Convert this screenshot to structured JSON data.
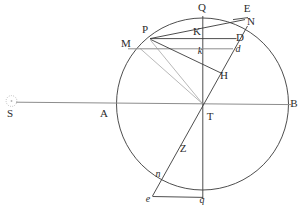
{
  "figure": {
    "background_color": "#ffffff",
    "ink_color": "#3a3a3a",
    "width": 307,
    "height": 209
  },
  "geometry": {
    "circle": {
      "cx": 202.5,
      "cy": 104,
      "r": 86
    },
    "center_point": "T",
    "horizontal_axis": {
      "from": "S",
      "through": [
        "A",
        "T"
      ],
      "to": "B"
    },
    "vertical_axis": {
      "from": "Q",
      "through": [
        "K",
        "k",
        "T"
      ],
      "to": "q"
    }
  },
  "labels": [
    {
      "id": "sun-symbol",
      "text": "☉",
      "x": 11,
      "y": 101,
      "style": "symbol"
    },
    {
      "id": "S",
      "text": "S",
      "x": 10,
      "y": 117,
      "style": "roman"
    },
    {
      "id": "A",
      "text": "A",
      "x": 104,
      "y": 117,
      "style": "roman"
    },
    {
      "id": "B",
      "text": "B",
      "x": 294,
      "y": 107,
      "style": "roman"
    },
    {
      "id": "Q",
      "text": "Q",
      "x": 202,
      "y": 11,
      "style": "roman"
    },
    {
      "id": "E",
      "text": "E",
      "x": 247,
      "y": 12,
      "style": "roman"
    },
    {
      "id": "N",
      "text": "N",
      "x": 251,
      "y": 25,
      "style": "roman"
    },
    {
      "id": "P",
      "text": "P",
      "x": 145,
      "y": 33,
      "style": "roman"
    },
    {
      "id": "M",
      "text": "M",
      "x": 126,
      "y": 47,
      "style": "roman"
    },
    {
      "id": "K",
      "text": "K",
      "x": 197,
      "y": 35,
      "style": "roman"
    },
    {
      "id": "D",
      "text": "D",
      "x": 240,
      "y": 41,
      "style": "roman"
    },
    {
      "id": "d",
      "text": "d",
      "x": 238,
      "y": 52,
      "style": "italic"
    },
    {
      "id": "k",
      "text": "k",
      "x": 200,
      "y": 54,
      "style": "italic"
    },
    {
      "id": "H",
      "text": "H",
      "x": 224,
      "y": 79,
      "style": "roman"
    },
    {
      "id": "T",
      "text": "T",
      "x": 210,
      "y": 120,
      "style": "roman"
    },
    {
      "id": "Z",
      "text": "Z",
      "x": 183,
      "y": 152,
      "style": "roman"
    },
    {
      "id": "n",
      "text": "n",
      "x": 158,
      "y": 177,
      "style": "italic"
    },
    {
      "id": "e",
      "text": "e",
      "x": 148,
      "y": 202,
      "style": "italic"
    },
    {
      "id": "q",
      "text": "q",
      "x": 202,
      "y": 203,
      "style": "italic"
    }
  ],
  "points": {
    "T": {
      "x": 202.5,
      "y": 104
    },
    "A": {
      "x": 116.5,
      "y": 104
    },
    "B": {
      "x": 288.5,
      "y": 104
    },
    "S": {
      "x": 12,
      "y": 101
    },
    "Q": {
      "x": 202.5,
      "y": 18
    },
    "q": {
      "x": 202.5,
      "y": 199
    },
    "P": {
      "x": 150,
      "y": 39
    },
    "M": {
      "x": 139,
      "y": 49
    },
    "K": {
      "x": 202.5,
      "y": 31
    },
    "k": {
      "x": 202.5,
      "y": 48
    },
    "E": {
      "x": 241,
      "y": 19
    },
    "N": {
      "x": 246,
      "y": 28
    },
    "D": {
      "x": 233,
      "y": 39
    },
    "d": {
      "x": 230,
      "y": 49
    },
    "H": {
      "x": 220,
      "y": 72
    },
    "n": {
      "x": 165,
      "y": 173
    },
    "e": {
      "x": 155,
      "y": 194
    },
    "Z": {
      "x": 186,
      "y": 145
    }
  },
  "segments": [
    {
      "name": "sun-ray-S-to-B",
      "from": "S",
      "to": "B"
    },
    {
      "name": "vertical-Q-to-q",
      "from": "Q",
      "to": "q"
    },
    {
      "name": "chord-P-to-E",
      "from": "P",
      "to": "E"
    },
    {
      "name": "chord-M-to-D",
      "from": "M",
      "to": "D"
    },
    {
      "name": "line-P-to-H",
      "from": "P",
      "to": "H"
    },
    {
      "name": "line-P-to-T",
      "from": "P",
      "to": "T"
    },
    {
      "name": "line-M-to-T",
      "from": "M",
      "to": "T"
    },
    {
      "name": "line-e-to-N",
      "from": "e",
      "to": "N"
    },
    {
      "name": "base-e-to-q",
      "from": "e",
      "to": "q"
    },
    {
      "name": "tick-H-to-d",
      "from": "H",
      "to": "d"
    }
  ]
}
